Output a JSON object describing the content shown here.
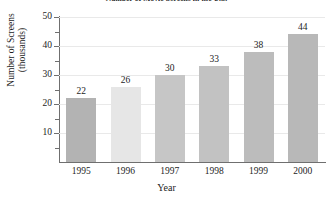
{
  "chart_data": {
    "type": "bar",
    "title": "Number of Movie Screens in the U.S.",
    "xlabel": "Year",
    "ylabel": "Number of Screens",
    "ylabel_line2": "(thousands)",
    "categories": [
      "1995",
      "1996",
      "1997",
      "1998",
      "1999",
      "2000"
    ],
    "values": [
      22,
      26,
      30,
      33,
      38,
      44
    ],
    "value_labels": [
      "22",
      "26",
      "30",
      "33",
      "38",
      "44"
    ],
    "ylim": [
      0,
      50
    ],
    "yticks": [
      10,
      20,
      30,
      40,
      50
    ],
    "ytick_labels": [
      "10",
      "20",
      "30",
      "40",
      "50"
    ],
    "yminor_ticks": [
      5,
      15,
      25,
      35,
      45
    ],
    "grid": true,
    "grid_axis": "y",
    "legend": false,
    "bar_colors": [
      "#b3b3b3",
      "#e6e6e6",
      "#c6c6c6",
      "#c2c2c2",
      "#bcbcbc",
      "#b8b8b8"
    ],
    "axis_color": "#6f6f6f",
    "grid_color": "#e9e9e9",
    "text_color": "#1d1d1d"
  }
}
